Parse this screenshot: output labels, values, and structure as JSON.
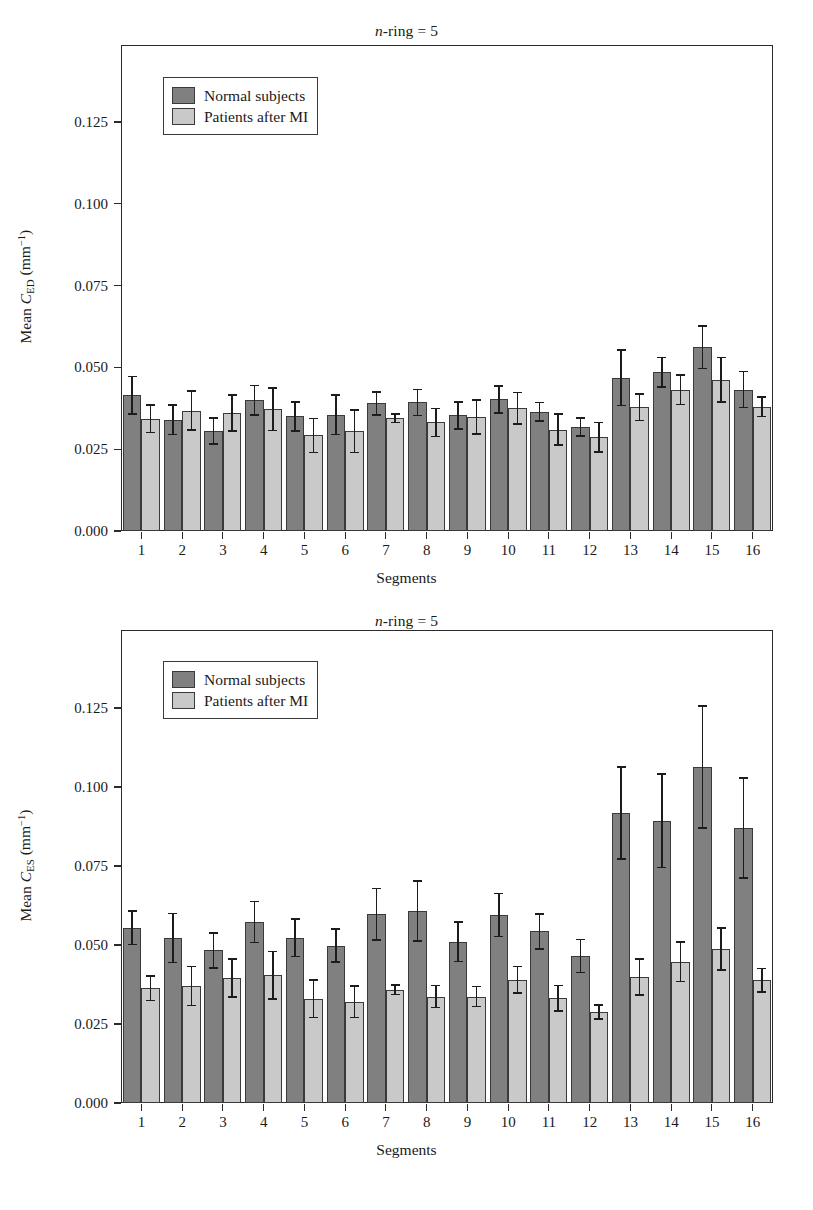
{
  "figures": [
    {
      "id": "ed",
      "title_prefix": "n",
      "title_rest": "-ring = 5",
      "ylabel_prefix": "Mean ",
      "ylabel_symbol": "C",
      "ylabel_sub": "ED",
      "ylabel_units": "(mm",
      "ylabel_units_sup": "−1",
      "ylabel_units_close": ")",
      "xlabel": "Segments",
      "legend": [
        {
          "key": "normal",
          "label": "Normal subjects"
        },
        {
          "key": "patient",
          "label": "Patients after MI"
        }
      ],
      "chart_data": {
        "type": "bar",
        "title": "n-ring = 5",
        "xlabel": "Segments",
        "ylabel": "Mean C_ED (mm^-1)",
        "ylim": [
          0.0,
          0.1458
        ],
        "yticks": [
          0.0,
          0.025,
          0.05,
          0.075,
          0.1,
          0.125
        ],
        "ytick_labels": [
          "0.000",
          "0.025",
          "0.050",
          "0.075",
          "0.100",
          "0.125"
        ],
        "grid": false,
        "legend_position": "upper-left",
        "categories": [
          "1",
          "2",
          "3",
          "4",
          "5",
          "6",
          "7",
          "8",
          "9",
          "10",
          "11",
          "12",
          "13",
          "14",
          "15",
          "16"
        ],
        "series": [
          {
            "name": "Normal subjects",
            "color": "#808080",
            "values": [
              0.0415,
              0.034,
              0.0305,
              0.04,
              0.035,
              0.0355,
              0.039,
              0.0393,
              0.0353,
              0.0402,
              0.0365,
              0.0318,
              0.0468,
              0.0485,
              0.0562,
              0.0432
            ],
            "errors": [
              0.0057,
              0.0045,
              0.004,
              0.0045,
              0.0045,
              0.006,
              0.0035,
              0.004,
              0.0042,
              0.0042,
              0.0028,
              0.0027,
              0.0085,
              0.0045,
              0.0065,
              0.0055
            ]
          },
          {
            "name": "Patients after MI",
            "color": "#c9c9c9",
            "values": [
              0.0343,
              0.0368,
              0.036,
              0.0372,
              0.0292,
              0.0305,
              0.0345,
              0.0332,
              0.0348,
              0.0375,
              0.031,
              0.0287,
              0.0378,
              0.0432,
              0.0462,
              0.038
            ],
            "errors": [
              0.0042,
              0.006,
              0.0055,
              0.0065,
              0.0052,
              0.0065,
              0.0013,
              0.0043,
              0.0052,
              0.0048,
              0.0047,
              0.0045,
              0.004,
              0.0045,
              0.0068,
              0.003
            ]
          }
        ]
      }
    },
    {
      "id": "es",
      "title_prefix": "n",
      "title_rest": "-ring = 5",
      "ylabel_prefix": "Mean ",
      "ylabel_symbol": "C",
      "ylabel_sub": "ES",
      "ylabel_units": "(mm",
      "ylabel_units_sup": "−1",
      "ylabel_units_close": ")",
      "xlabel": "Segments",
      "legend": [
        {
          "key": "normal",
          "label": "Normal subjects"
        },
        {
          "key": "patient",
          "label": "Patients after MI"
        }
      ],
      "chart_data": {
        "type": "bar",
        "title": "n-ring = 5",
        "xlabel": "Segments",
        "ylabel": "Mean C_ES (mm^-1)",
        "ylim": [
          0.0,
          0.1406
        ],
        "yticks": [
          0.0,
          0.025,
          0.05,
          0.075,
          0.1,
          0.125
        ],
        "ytick_labels": [
          "0.000",
          "0.025",
          "0.050",
          "0.075",
          "0.100",
          "0.125"
        ],
        "grid": false,
        "legend_position": "upper-left",
        "categories": [
          "1",
          "2",
          "3",
          "4",
          "5",
          "6",
          "7",
          "8",
          "9",
          "10",
          "11",
          "12",
          "13",
          "14",
          "15",
          "16"
        ],
        "series": [
          {
            "name": "Normal subjects",
            "color": "#808080",
            "values": [
              0.0555,
              0.0522,
              0.0483,
              0.0573,
              0.0523,
              0.0498,
              0.0597,
              0.0607,
              0.051,
              0.0595,
              0.0543,
              0.0465,
              0.0918,
              0.0893,
              0.1063,
              0.087
            ],
            "errors": [
              0.0053,
              0.0078,
              0.0055,
              0.0065,
              0.006,
              0.0052,
              0.0082,
              0.0095,
              0.0062,
              0.0068,
              0.0055,
              0.0052,
              0.0145,
              0.0148,
              0.0193,
              0.0158
            ]
          },
          {
            "name": "Patients after MI",
            "color": "#c9c9c9",
            "values": [
              0.0363,
              0.037,
              0.0395,
              0.0405,
              0.033,
              0.032,
              0.0358,
              0.0337,
              0.0337,
              0.039,
              0.0332,
              0.0288,
              0.0398,
              0.0447,
              0.0487,
              0.0388
            ],
            "errors": [
              0.0038,
              0.0062,
              0.006,
              0.0075,
              0.006,
              0.005,
              0.0015,
              0.0035,
              0.0032,
              0.0042,
              0.004,
              0.0023,
              0.0057,
              0.0062,
              0.0067,
              0.0037
            ]
          }
        ]
      }
    }
  ]
}
